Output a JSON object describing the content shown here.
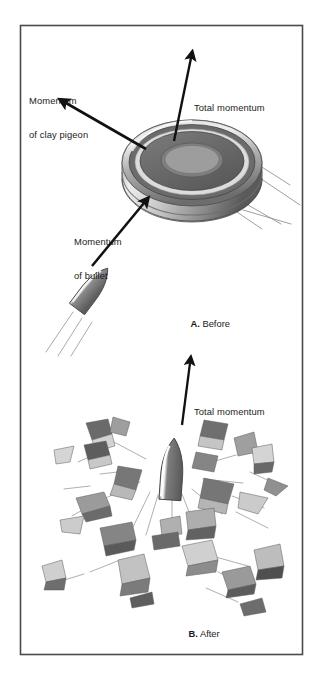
{
  "figure": {
    "title_alt": "Conservation of momentum: bullet striking a clay pigeon",
    "frame": {
      "border_color": "#4a4a4a",
      "background": "#ffffff"
    },
    "ink_color": "#111111",
    "palette": {
      "clay_dark": "#5f5f5f",
      "clay_mid": "#8d8d8d",
      "clay_light": "#c9c9c9",
      "clay_highlight": "#e8e8e8",
      "bullet_body": "#6e6e6e",
      "bullet_highlight": "#f2f2f2",
      "debris_dark": "#555555",
      "debris_mid": "#9a9a9a",
      "debris_light": "#cfcfcf",
      "motion_line": "#8a8a8a"
    }
  },
  "panel_a": {
    "id": "A",
    "caption_letter": "A.",
    "caption_text": " Before",
    "labels": [
      {
        "name": "momentum-of-clay-pigeon",
        "line1": "Momentum",
        "line2": "of clay pigeon",
        "x": 29,
        "y": 72
      },
      {
        "name": "total-momentum-before",
        "line1": "Total momentum",
        "line2": "",
        "x": 194,
        "y": 79
      },
      {
        "name": "momentum-of-bullet",
        "line1": "Momentum",
        "line2": "of bullet",
        "x": 74,
        "y": 213
      }
    ],
    "arrows": [
      {
        "name": "arrow-clay-pigeon-momentum",
        "from_x": 146,
        "from_y": 149,
        "to_x": 62,
        "to_y": 100
      },
      {
        "name": "arrow-total-momentum-before",
        "from_x": 174,
        "from_y": 141,
        "to_x": 192,
        "to_y": 54
      },
      {
        "name": "arrow-bullet-momentum",
        "from_x": 92,
        "from_y": 266,
        "to_x": 146,
        "to_y": 200
      }
    ],
    "objects": [
      {
        "name": "clay-pigeon-disc",
        "cx": 192,
        "cy": 155
      },
      {
        "name": "bullet-in-flight",
        "cx": 92,
        "cy": 289
      }
    ]
  },
  "panel_b": {
    "id": "B",
    "caption_letter": "B.",
    "caption_text": " After",
    "labels": [
      {
        "name": "total-momentum-after",
        "line1": "Total momentum",
        "line2": "",
        "x": 194,
        "y": 383
      }
    ],
    "arrows": [
      {
        "name": "arrow-total-momentum-after",
        "from_x": 182,
        "from_y": 425,
        "to_x": 190,
        "to_y": 360
      }
    ],
    "objects": [
      {
        "name": "bullet-after-impact",
        "cx": 172,
        "cy": 470
      },
      {
        "name": "debris-field",
        "cx": 165,
        "cy": 520
      }
    ]
  },
  "captions": {
    "a_x": 180,
    "a_y": 307,
    "b_x": 178,
    "b_y": 617
  }
}
